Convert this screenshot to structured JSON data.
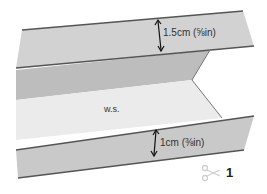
{
  "diagram": {
    "labels": {
      "top_allowance": "1.5cm (⅝in)",
      "bottom_allowance": "1cm (⅜in)",
      "wrong_side": "w.s.",
      "step_number": "1"
    },
    "icons": {
      "scissors": "scissors-icon",
      "top_arrow": "double-arrow-icon",
      "bottom_arrow": "double-arrow-icon"
    },
    "colors": {
      "top_flap": "#d2d2d2",
      "inner_fold": "#bdbdbd",
      "wrong_side_panel": "#ebebeb",
      "bottom_flap": "#c9c9c9",
      "edge_line": "#555555",
      "scissors": "#cfcfcf"
    }
  }
}
